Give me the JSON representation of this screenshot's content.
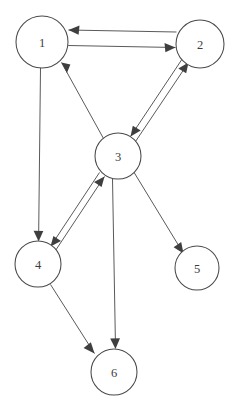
{
  "diagram": {
    "type": "directed-graph",
    "background_color": "#ffffff",
    "node_stroke_color": "#4a4a4a",
    "edge_color": "#5a5a5a",
    "arrow_color": "#3f3f3f",
    "label_color": "#3c3c3c",
    "nodes": [
      {
        "id": "1",
        "label": "1",
        "cx": 42,
        "cy": 42,
        "r": 26
      },
      {
        "id": "2",
        "label": "2",
        "cx": 200,
        "cy": 44,
        "r": 24
      },
      {
        "id": "3",
        "label": "3",
        "cx": 118,
        "cy": 156,
        "r": 23
      },
      {
        "id": "4",
        "label": "4",
        "cx": 38,
        "cy": 264,
        "r": 23
      },
      {
        "id": "5",
        "label": "5",
        "cx": 197,
        "cy": 268,
        "r": 22
      },
      {
        "id": "6",
        "label": "6",
        "cx": 114,
        "cy": 372,
        "r": 23
      }
    ],
    "edges": [
      {
        "from": "2",
        "to": "1",
        "directed": true,
        "style": "parallel-pair"
      },
      {
        "from": "1",
        "to": "2",
        "directed": true,
        "style": "parallel-pair"
      },
      {
        "from": "3",
        "to": "1",
        "directed": true,
        "style": "single"
      },
      {
        "from": "1",
        "to": "4",
        "directed": true,
        "style": "single"
      },
      {
        "from": "3",
        "to": "2",
        "directed": true,
        "style": "parallel-pair"
      },
      {
        "from": "2",
        "to": "3",
        "directed": true,
        "style": "parallel-pair"
      },
      {
        "from": "4",
        "to": "3",
        "directed": true,
        "style": "parallel-pair"
      },
      {
        "from": "3",
        "to": "4",
        "directed": true,
        "style": "parallel-pair"
      },
      {
        "from": "3",
        "to": "5",
        "directed": true,
        "style": "single"
      },
      {
        "from": "3",
        "to": "6",
        "directed": true,
        "style": "single"
      },
      {
        "from": "4",
        "to": "6",
        "directed": true,
        "style": "single"
      }
    ]
  }
}
